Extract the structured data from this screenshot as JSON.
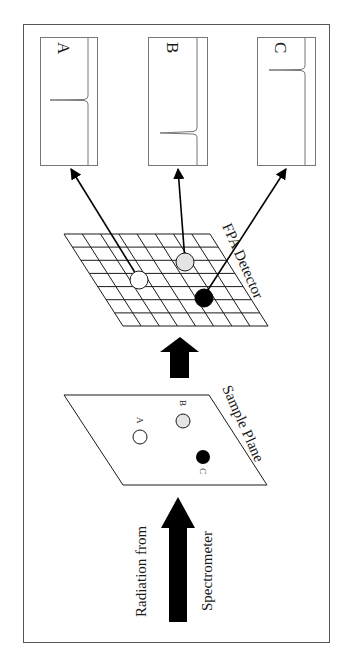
{
  "figure": {
    "colors": {
      "line": "#1a1a1a",
      "frame": "#555555",
      "spectrum_frame": "#777777",
      "sample_a_fill": "#ffffff",
      "sample_b_fill": "#e4e4e4",
      "sample_c_fill": "#000000"
    }
  },
  "spectra": [
    {
      "label": "A",
      "peak_position": "middle"
    },
    {
      "label": "B",
      "peak_position": "low"
    },
    {
      "label": "C",
      "peak_position": "high"
    }
  ],
  "detector": {
    "label": "FPA Detector",
    "grid_rows": 7,
    "grid_cols": 8
  },
  "sample_plane": {
    "label": "Sample Plane",
    "samples": [
      {
        "label": "A",
        "fill": "white"
      },
      {
        "label": "B",
        "fill": "gray"
      },
      {
        "label": "C",
        "fill": "black"
      }
    ]
  },
  "source": {
    "line1": "Radiation from",
    "line2": "Spectrometer"
  }
}
